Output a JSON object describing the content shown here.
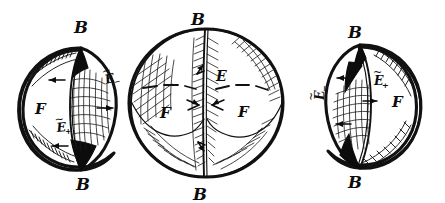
{
  "figure": {
    "background_color": "#ffffff",
    "ink_color": "#111111",
    "panel_count": 3
  },
  "panels": [
    {
      "id": "left-sphere",
      "name": "sphere-left",
      "description": "Sphere with a narrow vertical lens (lune) on the right side, cross-hatched, with solid black tips at top and bottom of the lens",
      "center": {
        "x": 71,
        "y": 107
      },
      "radius_x": 52,
      "radius_y": 57,
      "labels": [
        {
          "key": "top-boundary",
          "text": "B",
          "sub": "",
          "tilde": false,
          "x": 81,
          "y": 28
        },
        {
          "key": "bottom-boundary",
          "text": "B",
          "sub": "",
          "tilde": false,
          "x": 81,
          "y": 185
        },
        {
          "key": "face",
          "text": "F",
          "sub": "",
          "tilde": false,
          "x": 41,
          "y": 113
        },
        {
          "key": "upper-edge",
          "text": "E",
          "sub": "−",
          "tilde": true,
          "x": 109,
          "y": 80,
          "rotation": -12
        },
        {
          "key": "lower-edge",
          "text": "E",
          "sub": "+",
          "tilde": true,
          "x": 60,
          "y": 132,
          "rotation": 0
        }
      ],
      "arrows": [
        {
          "key": "upper-left-arrow",
          "direction": "left",
          "x": 55,
          "y": 80
        },
        {
          "key": "right-arrow",
          "direction": "right",
          "x": 100,
          "y": 108
        },
        {
          "key": "lower-left-arrow",
          "direction": "left",
          "x": 57,
          "y": 144
        }
      ]
    },
    {
      "id": "middle-sphere",
      "name": "sphere-middle",
      "description": "Large sphere split by a vertical great circle, hatched bands along the meridian and the rim, with two F regions separated by dashed arcs",
      "center": {
        "x": 206,
        "y": 103
      },
      "radius_x": 78,
      "radius_y": 75,
      "labels": [
        {
          "key": "top-boundary",
          "text": "B",
          "sub": "",
          "tilde": false,
          "x": 198,
          "y": 20
        },
        {
          "key": "bottom-boundary",
          "text": "B",
          "sub": "",
          "tilde": false,
          "x": 200,
          "y": 196
        },
        {
          "key": "edge",
          "text": "E",
          "sub": "",
          "tilde": false,
          "x": 213,
          "y": 76
        },
        {
          "key": "face-left",
          "text": "F",
          "sub": "",
          "tilde": false,
          "x": 164,
          "y": 113
        },
        {
          "key": "face-right",
          "text": "F",
          "sub": "",
          "tilde": false,
          "x": 242,
          "y": 112
        }
      ],
      "arrows": [
        {
          "key": "meridian-arrow-upper",
          "direction": "up",
          "x": 193,
          "y": 68
        },
        {
          "key": "meridian-arrow-left",
          "direction": "right",
          "x": 192,
          "y": 104
        },
        {
          "key": "meridian-arrow-right",
          "direction": "left",
          "x": 212,
          "y": 104
        },
        {
          "key": "meridian-arrow-lower",
          "direction": "down",
          "x": 194,
          "y": 148
        }
      ]
    },
    {
      "id": "right-sphere",
      "name": "sphere-right",
      "description": "Mirror image of the left sphere; narrow vertical lens on the left side, cross-hatched with solid black tips",
      "center": {
        "x": 372,
        "y": 103
      },
      "radius_x": 50,
      "radius_y": 56,
      "labels": [
        {
          "key": "top-boundary",
          "text": "B",
          "sub": "",
          "tilde": false,
          "x": 354,
          "y": 33
        },
        {
          "key": "bottom-boundary",
          "text": "B",
          "sub": "",
          "tilde": false,
          "x": 354,
          "y": 182
        },
        {
          "key": "face",
          "text": "F",
          "sub": "",
          "tilde": false,
          "x": 397,
          "y": 103
        },
        {
          "key": "inner-edge",
          "text": "E",
          "sub": "+",
          "tilde": true,
          "x": 374,
          "y": 81
        },
        {
          "key": "outer-edge",
          "text": "E",
          "sub": "−",
          "tilde": true,
          "x": 324,
          "y": 96,
          "rotation": -90
        }
      ],
      "arrows": [
        {
          "key": "upper-left-arrow",
          "direction": "left",
          "x": 343,
          "y": 78
        },
        {
          "key": "inner-right-arrow",
          "direction": "right",
          "x": 366,
          "y": 100
        },
        {
          "key": "lower-left-arrow",
          "direction": "left",
          "x": 345,
          "y": 122
        }
      ]
    }
  ],
  "legend": {
    "B": "B",
    "E": "E",
    "F": "F",
    "E_plus": "+",
    "E_minus": "−"
  }
}
